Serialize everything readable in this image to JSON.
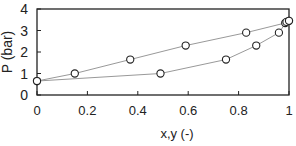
{
  "chart_data": {
    "type": "scatter",
    "title": "",
    "xlabel": "x,y (-)",
    "ylabel": "P (bar)",
    "xlim": [
      0,
      1
    ],
    "ylim": [
      0,
      4
    ],
    "xticks": [
      "0",
      "0.2",
      "0.4",
      "0.6",
      "0.8",
      "1"
    ],
    "yticks": [
      "0",
      "1",
      "2",
      "3",
      "4"
    ],
    "grid": false,
    "legend": null,
    "series": [
      {
        "name": "bubble (x)",
        "marker": "open-circle",
        "line": true,
        "x": [
          0,
          0.15,
          0.37,
          0.59,
          0.83,
          0.985,
          1.0
        ],
        "y": [
          0.65,
          1.0,
          1.65,
          2.3,
          2.9,
          3.35,
          3.45
        ]
      },
      {
        "name": "dew (y)",
        "marker": "open-circle",
        "line": true,
        "x": [
          0,
          0.49,
          0.75,
          0.87,
          0.96,
          0.99,
          1.0
        ],
        "y": [
          0.65,
          1.0,
          1.65,
          2.3,
          2.9,
          3.4,
          3.45
        ]
      }
    ],
    "colors": {
      "axis": "#222222",
      "line": "#999999",
      "marker": "#222222"
    }
  }
}
